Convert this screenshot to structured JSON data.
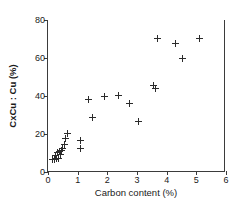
{
  "chart_data": {
    "type": "scatter",
    "title": "",
    "xlabel": "Carbon content (%)",
    "ylabel": "CxCu : Cu (%)",
    "xlim": [
      0,
      6
    ],
    "ylim": [
      0,
      80
    ],
    "xticks": [
      0,
      1,
      2,
      3,
      4,
      5,
      6
    ],
    "yticks": [
      0,
      20,
      40,
      60,
      80
    ],
    "grid": false,
    "legend": null,
    "marker": "plus",
    "marker_color": "#2b2b2b",
    "series": [
      {
        "name": "CxCu:Cu vs carbon content",
        "points": [
          [
            0.14,
            6.5
          ],
          [
            0.22,
            6.8
          ],
          [
            0.26,
            8.5
          ],
          [
            0.3,
            7.0
          ],
          [
            0.32,
            10.5
          ],
          [
            0.36,
            7.2
          ],
          [
            0.4,
            11.0
          ],
          [
            0.43,
            9.0
          ],
          [
            0.46,
            11.5
          ],
          [
            0.5,
            12.5
          ],
          [
            0.55,
            14.5
          ],
          [
            0.6,
            17.5
          ],
          [
            0.66,
            20.5
          ],
          [
            1.08,
            16.5
          ],
          [
            1.1,
            12.5
          ],
          [
            1.38,
            38.0
          ],
          [
            1.5,
            28.5
          ],
          [
            1.9,
            40.0
          ],
          [
            2.38,
            40.2
          ],
          [
            2.76,
            36.2
          ],
          [
            3.05,
            26.8
          ],
          [
            3.55,
            45.5
          ],
          [
            3.62,
            43.8
          ],
          [
            3.68,
            70.5
          ],
          [
            4.3,
            67.5
          ],
          [
            4.52,
            60.0
          ],
          [
            5.1,
            70.5
          ]
        ]
      }
    ]
  },
  "axis": {
    "x_tick_labels": [
      "0",
      "1",
      "2",
      "3",
      "4",
      "5",
      "6"
    ],
    "y_tick_labels": [
      "0",
      "20",
      "40",
      "60",
      "80"
    ]
  }
}
